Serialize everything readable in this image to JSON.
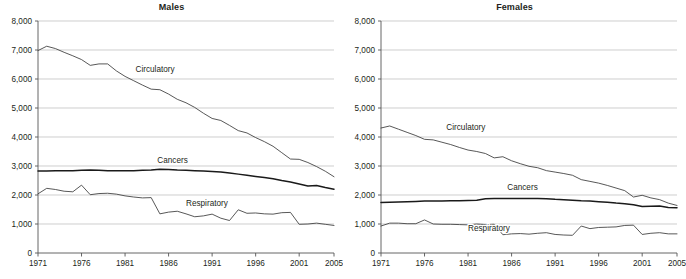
{
  "figure": {
    "panels": [
      "males",
      "females"
    ]
  },
  "chart_data": [
    {
      "type": "line",
      "title": "Males",
      "xlabel": "",
      "ylabel": "",
      "xlim": [
        1971,
        2005
      ],
      "ylim": [
        0,
        8000
      ],
      "grid": true,
      "legend_position": "inline-annotations",
      "xticks": [
        1971,
        1976,
        1981,
        1986,
        1991,
        1996,
        2001,
        2005
      ],
      "xtick_labels": [
        "1971",
        "1976",
        "1981",
        "1986",
        "1991",
        "1996",
        "2001",
        "2005"
      ],
      "yticks": [
        0,
        1000,
        2000,
        3000,
        4000,
        5000,
        6000,
        7000,
        8000
      ],
      "ytick_labels": [
        "0",
        "1,000",
        "2,000",
        "3,000",
        "4,000",
        "5,000",
        "6,000",
        "7,000",
        "8,000"
      ],
      "x": [
        1971,
        1972,
        1973,
        1974,
        1975,
        1976,
        1977,
        1978,
        1979,
        1980,
        1981,
        1982,
        1983,
        1984,
        1985,
        1986,
        1987,
        1988,
        1989,
        1990,
        1991,
        1992,
        1993,
        1994,
        1995,
        1996,
        1997,
        1998,
        1999,
        2000,
        2001,
        2002,
        2003,
        2004,
        2005
      ],
      "series": [
        {
          "name": "Circulatory",
          "label": "Circulatory",
          "label_x": 1982.2,
          "label_y": 6250,
          "style": "thin",
          "values": [
            6980,
            7130,
            7050,
            6920,
            6800,
            6670,
            6470,
            6520,
            6520,
            6280,
            6090,
            5940,
            5790,
            5650,
            5630,
            5480,
            5300,
            5180,
            5020,
            4820,
            4640,
            4570,
            4400,
            4220,
            4140,
            3980,
            3840,
            3680,
            3460,
            3240,
            3230,
            3120,
            2980,
            2820,
            2630
          ]
        },
        {
          "name": "Cancers",
          "label": "Cancers",
          "label_x": 1984.7,
          "label_y": 3120,
          "style": "bold",
          "values": [
            2830,
            2830,
            2840,
            2840,
            2840,
            2850,
            2860,
            2850,
            2840,
            2840,
            2840,
            2840,
            2850,
            2860,
            2890,
            2880,
            2860,
            2850,
            2840,
            2830,
            2810,
            2790,
            2760,
            2720,
            2680,
            2640,
            2600,
            2560,
            2500,
            2450,
            2380,
            2310,
            2330,
            2260,
            2200
          ]
        },
        {
          "name": "Respiratory",
          "label": "Respiratory",
          "label_x": 1988.0,
          "label_y": 1620,
          "style": "thin",
          "values": [
            2040,
            2230,
            2190,
            2130,
            2110,
            2340,
            2010,
            2050,
            2060,
            2030,
            1970,
            1930,
            1900,
            1910,
            1350,
            1410,
            1440,
            1350,
            1250,
            1280,
            1340,
            1200,
            1120,
            1490,
            1370,
            1380,
            1350,
            1340,
            1390,
            1400,
            990,
            1000,
            1030,
            990,
            950
          ]
        }
      ]
    },
    {
      "type": "line",
      "title": "Females",
      "xlabel": "",
      "ylabel": "",
      "xlim": [
        1971,
        2005
      ],
      "ylim": [
        0,
        8000
      ],
      "grid": true,
      "legend_position": "inline-annotations",
      "xticks": [
        1971,
        1976,
        1981,
        1986,
        1991,
        1996,
        2001,
        2005
      ],
      "xtick_labels": [
        "1971",
        "1976",
        "1981",
        "1986",
        "1991",
        "1996",
        "2001",
        "2005"
      ],
      "yticks": [
        0,
        1000,
        2000,
        3000,
        4000,
        5000,
        6000,
        7000,
        8000
      ],
      "ytick_labels": [
        "0",
        "1,000",
        "2,000",
        "3,000",
        "4,000",
        "5,000",
        "6,000",
        "7,000",
        "8,000"
      ],
      "x": [
        1971,
        1972,
        1973,
        1974,
        1975,
        1976,
        1977,
        1978,
        1979,
        1980,
        1981,
        1982,
        1983,
        1984,
        1985,
        1986,
        1987,
        1988,
        1989,
        1990,
        1991,
        1992,
        1993,
        1994,
        1995,
        1996,
        1997,
        1998,
        1999,
        2000,
        2001,
        2002,
        2003,
        2004,
        2005
      ],
      "series": [
        {
          "name": "Circulatory",
          "label": "Circulatory",
          "label_x": 1978.5,
          "label_y": 4250,
          "style": "thin",
          "values": [
            4310,
            4380,
            4270,
            4160,
            4050,
            3920,
            3900,
            3820,
            3740,
            3640,
            3550,
            3500,
            3430,
            3280,
            3320,
            3180,
            3080,
            2990,
            2940,
            2840,
            2790,
            2740,
            2680,
            2530,
            2470,
            2410,
            2330,
            2240,
            2150,
            1930,
            1990,
            1900,
            1840,
            1720,
            1640
          ]
        },
        {
          "name": "Cancers",
          "label": "Cancers",
          "label_x": 1985.5,
          "label_y": 2160,
          "style": "bold",
          "values": [
            1740,
            1750,
            1760,
            1770,
            1780,
            1790,
            1790,
            1790,
            1800,
            1800,
            1810,
            1820,
            1870,
            1880,
            1880,
            1880,
            1880,
            1880,
            1880,
            1870,
            1850,
            1840,
            1820,
            1800,
            1790,
            1770,
            1750,
            1720,
            1700,
            1660,
            1600,
            1610,
            1620,
            1570,
            1560
          ]
        },
        {
          "name": "Respiratory",
          "label": "Respiratory",
          "label_x": 1981.0,
          "label_y": 760,
          "style": "thin",
          "values": [
            930,
            1030,
            1030,
            1010,
            1010,
            1140,
            1000,
            990,
            990,
            980,
            970,
            1000,
            980,
            990,
            630,
            660,
            670,
            650,
            680,
            700,
            640,
            620,
            610,
            930,
            840,
            880,
            890,
            900,
            950,
            960,
            640,
            680,
            700,
            660,
            660
          ]
        }
      ]
    }
  ]
}
